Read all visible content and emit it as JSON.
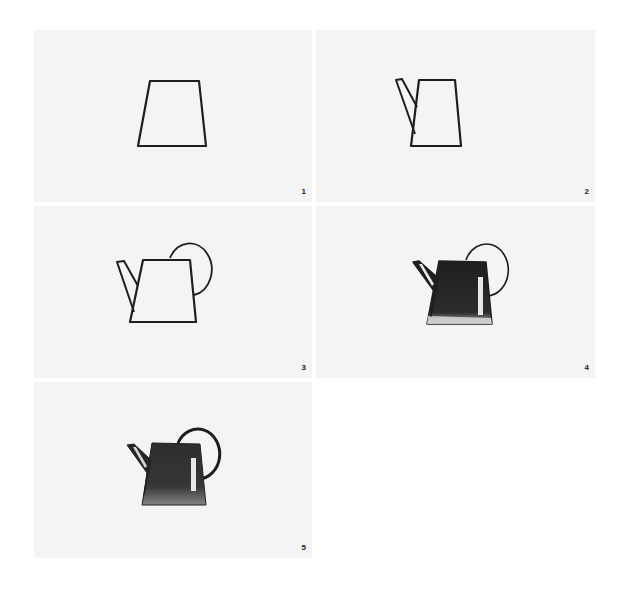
{
  "colors": {
    "page_background": "#ffffff",
    "panel_background": "#f4f4f4",
    "ink": "#1e1e1e",
    "highlight": "#e8e8e8"
  },
  "panels": [
    {
      "step": "1",
      "elements": [
        "body"
      ],
      "filled": false
    },
    {
      "step": "2",
      "elements": [
        "body",
        "spout"
      ],
      "filled": false
    },
    {
      "step": "3",
      "elements": [
        "body",
        "spout",
        "handle"
      ],
      "filled": false
    },
    {
      "step": "4",
      "elements": [
        "body",
        "spout",
        "handle",
        "shading",
        "highlight"
      ],
      "filled": true
    },
    {
      "step": "5",
      "elements": [
        "body",
        "spout",
        "handle",
        "shading",
        "highlight"
      ],
      "filled": true
    }
  ]
}
